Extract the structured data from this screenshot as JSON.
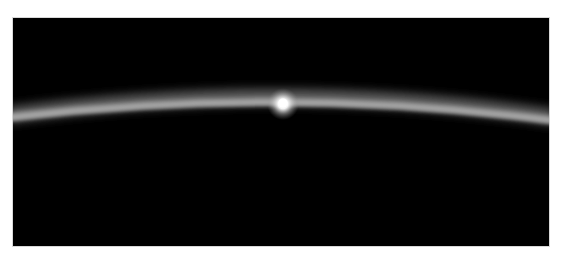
{
  "image": {
    "subject": "planetary-limb-sunrise",
    "colors": {
      "space": "#000000",
      "atmosphere_glow": "#9a9a9a",
      "atmosphere_core": "#bdbdbd",
      "sun": "#ffffff",
      "page_background": "#ffffff"
    }
  }
}
